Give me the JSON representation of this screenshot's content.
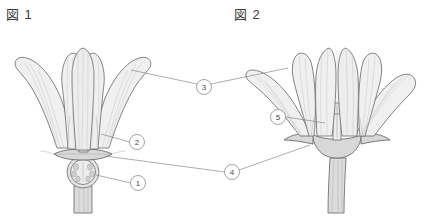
{
  "figure": {
    "background_color": "#ffffff",
    "outline_color": "#6e6e6e",
    "fill_color": "#f0f0f0",
    "leader_color": "#8a8a8a",
    "text_color": "#3c3c3c"
  },
  "captions": {
    "left": "図 1",
    "right": "図 2"
  },
  "callouts": [
    {
      "id": "1",
      "label": "1",
      "x": 138,
      "y": 183,
      "r": 7.5,
      "target": "ovary-left"
    },
    {
      "id": "2",
      "label": "2",
      "x": 137,
      "y": 142,
      "r": 7.5,
      "target": "stamens-left"
    },
    {
      "id": "3",
      "label": "3",
      "x": 204,
      "y": 87,
      "r": 7.5,
      "target": "petals-both"
    },
    {
      "id": "4",
      "label": "4",
      "x": 232,
      "y": 173,
      "r": 7.5,
      "target": "receptacle-both"
    },
    {
      "id": "5",
      "label": "5",
      "x": 278,
      "y": 117,
      "r": 7.5,
      "target": "pistil-right"
    }
  ],
  "leader_lines": [
    {
      "from": "callout-3",
      "to": "left-petal-edge",
      "x1": 197,
      "y1": 84,
      "x2": 131,
      "y2": 70
    },
    {
      "from": "callout-3",
      "to": "right-petal-edge",
      "x1": 211,
      "y1": 84,
      "x2": 288,
      "y2": 68
    },
    {
      "from": "callout-2",
      "to": "left-stamens",
      "x1": 130,
      "y1": 142,
      "x2": 101,
      "y2": 134
    },
    {
      "from": "callout-1",
      "to": "left-ovary",
      "x1": 131,
      "y1": 183,
      "x2": 96,
      "y2": 175
    },
    {
      "from": "callout-4",
      "to": "left-receptacle",
      "x1": 225,
      "y1": 172,
      "x2": 105,
      "y2": 156
    },
    {
      "from": "callout-4",
      "to": "right-receptacle",
      "x1": 239,
      "y1": 170,
      "x2": 310,
      "y2": 145
    },
    {
      "from": "callout-5",
      "to": "right-pistil",
      "x1": 286,
      "y1": 117,
      "x2": 325,
      "y2": 123
    }
  ],
  "figures": [
    {
      "name": "figure-1",
      "caption": "図 1",
      "description": "Flower with upright bell-shaped corolla, visible stamens and a rounded inferior ovary",
      "parts": [
        "petals",
        "stamens",
        "receptacle",
        "ovary",
        "pedicel"
      ]
    },
    {
      "name": "figure-2",
      "caption": "図 2",
      "description": "Flower with spreading funnel-shaped corolla, reflexed sepals and a thick pedicel",
      "parts": [
        "petals",
        "pistil",
        "sepals",
        "receptacle",
        "pedicel"
      ]
    }
  ]
}
